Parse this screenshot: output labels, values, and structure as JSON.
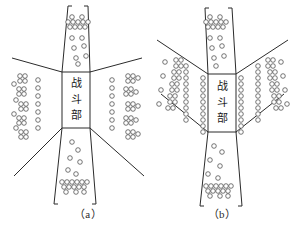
{
  "figure": {
    "background_color": "#ffffff",
    "line_color": "#2b2b2b",
    "circle_stroke_color": "#4a4a4a",
    "circle_fill_color": "#ffffff",
    "text_color": "#1a1a1a"
  },
  "panels": [
    {
      "id": "panel-a",
      "caption": "（a）",
      "caption_x": 88,
      "caption_y": 218,
      "warhead": {
        "label_chars": [
          "战",
          "斗",
          "部"
        ],
        "label_full": "战斗部",
        "x": 62,
        "y": 72,
        "width": 28,
        "height": 56
      },
      "outlines": [
        "M 62 72 L 68 6 L 72 6",
        "M 90 72 L 88 6 L 84 6",
        "M 62 128 L 54 204 L 58 204",
        "M 90 128 L 96 204 L 92 204",
        "M 62 72 L 12 58",
        "M 62 128 L 14 176",
        "M 90 72 L 142 58",
        "M 90 128 L 144 176"
      ],
      "circle_radius": 2.3,
      "circle_groups": [
        {
          "name": "top-cone-dense-band",
          "points": [
            [
              68,
              22
            ],
            [
              73,
              22
            ],
            [
              78,
              22
            ],
            [
              83,
              22
            ],
            [
              88,
              22
            ],
            [
              70,
              27
            ],
            [
              75,
              27
            ],
            [
              80,
              27
            ],
            [
              85,
              27
            ],
            [
              72,
              17
            ],
            [
              82,
              17
            ]
          ]
        },
        {
          "name": "top-cone-sparse",
          "points": [
            [
              72,
              38
            ],
            [
              82,
              38
            ],
            [
              74,
              48
            ],
            [
              84,
              46
            ],
            [
              76,
              58
            ],
            [
              86,
              56
            ],
            [
              78,
              64
            ]
          ]
        },
        {
          "name": "bottom-cone-sparse",
          "points": [
            [
              72,
              142
            ],
            [
              78,
              150
            ],
            [
              70,
              158
            ],
            [
              80,
              162
            ],
            [
              68,
              170
            ],
            [
              76,
              174
            ]
          ]
        },
        {
          "name": "bottom-cone-dense-band",
          "points": [
            [
              62,
              182
            ],
            [
              67,
              182
            ],
            [
              72,
              182
            ],
            [
              77,
              182
            ],
            [
              82,
              182
            ],
            [
              87,
              182
            ],
            [
              64,
              187
            ],
            [
              69,
              187
            ],
            [
              74,
              187
            ],
            [
              79,
              187
            ],
            [
              84,
              187
            ],
            [
              66,
              192
            ],
            [
              76,
              192
            ],
            [
              84,
              192
            ]
          ]
        },
        {
          "name": "left-fan-sparse-column",
          "points": [
            [
              38,
              80
            ],
            [
              38,
              88
            ],
            [
              38,
              96
            ],
            [
              38,
              104
            ],
            [
              38,
              112
            ],
            [
              38,
              120
            ],
            [
              38,
              128
            ]
          ]
        },
        {
          "name": "left-fan-dense-clusters",
          "points": [
            [
              20,
              76
            ],
            [
              25,
              76
            ],
            [
              20,
              81
            ],
            [
              25,
              81
            ],
            [
              14,
              84
            ],
            [
              19,
              89
            ],
            [
              24,
              89
            ],
            [
              19,
              94
            ],
            [
              24,
              94
            ],
            [
              16,
              100
            ],
            [
              21,
              104
            ],
            [
              26,
              104
            ],
            [
              21,
              109
            ],
            [
              26,
              109
            ],
            [
              14,
              114
            ],
            [
              19,
              118
            ],
            [
              24,
              118
            ],
            [
              19,
              123
            ],
            [
              24,
              123
            ],
            [
              16,
              128
            ],
            [
              21,
              132
            ],
            [
              26,
              132
            ],
            [
              21,
              137
            ],
            [
              26,
              137
            ]
          ]
        },
        {
          "name": "right-fan-sparse-column",
          "points": [
            [
              112,
              80
            ],
            [
              112,
              88
            ],
            [
              112,
              96
            ],
            [
              112,
              104
            ],
            [
              112,
              112
            ],
            [
              112,
              120
            ],
            [
              112,
              128
            ]
          ]
        },
        {
          "name": "right-fan-dense-clusters",
          "points": [
            [
              128,
              76
            ],
            [
              133,
              76
            ],
            [
              128,
              81
            ],
            [
              133,
              81
            ],
            [
              138,
              78
            ],
            [
              126,
              89
            ],
            [
              131,
              89
            ],
            [
              126,
              94
            ],
            [
              131,
              94
            ],
            [
              136,
              92
            ],
            [
              128,
              104
            ],
            [
              133,
              104
            ],
            [
              128,
              109
            ],
            [
              133,
              109
            ],
            [
              138,
              106
            ],
            [
              126,
              118
            ],
            [
              131,
              118
            ],
            [
              126,
              123
            ],
            [
              131,
              123
            ],
            [
              136,
              120
            ],
            [
              128,
              132
            ],
            [
              133,
              132
            ],
            [
              128,
              137
            ],
            [
              133,
              137
            ],
            [
              138,
              134
            ]
          ]
        }
      ]
    },
    {
      "id": "panel-b",
      "caption": "（b）",
      "caption_x": 222,
      "caption_y": 218,
      "warhead": {
        "label_chars": [
          "战",
          "斗",
          "部"
        ],
        "label_full": "战斗部",
        "x": 208,
        "y": 74,
        "width": 28,
        "height": 58
      },
      "outlines": [
        "M 208 74 L 205 8 L 209 8",
        "M 236 74 L 232 8 L 228 8",
        "M 208 132 L 200 206 L 204 206",
        "M 236 132 L 242 206 L 238 206",
        "M 208 74 L 157 40",
        "M 208 132 L 161 94",
        "M 236 74 L 288 40",
        "M 236 132 L 284 94"
      ],
      "circle_radius": 2.3,
      "circle_groups": [
        {
          "name": "top-cone-dense-band",
          "points": [
            [
              206,
              22
            ],
            [
              211,
              22
            ],
            [
              216,
              22
            ],
            [
              221,
              22
            ],
            [
              226,
              22
            ],
            [
              208,
              27
            ],
            [
              213,
              27
            ],
            [
              218,
              27
            ],
            [
              223,
              27
            ],
            [
              210,
              17
            ],
            [
              220,
              17
            ]
          ]
        },
        {
          "name": "top-cone-sparse",
          "points": [
            [
              210,
              38
            ],
            [
              220,
              38
            ],
            [
              212,
              48
            ],
            [
              222,
              46
            ],
            [
              214,
              58
            ],
            [
              224,
              56
            ],
            [
              216,
              66
            ]
          ]
        },
        {
          "name": "bottom-cone-sparse",
          "points": [
            [
              214,
              146
            ],
            [
              222,
              152
            ],
            [
              210,
              160
            ],
            [
              220,
              166
            ],
            [
              208,
              174
            ],
            [
              218,
              178
            ]
          ]
        },
        {
          "name": "bottom-cone-dense-band",
          "points": [
            [
              206,
              186
            ],
            [
              211,
              186
            ],
            [
              216,
              186
            ],
            [
              221,
              186
            ],
            [
              226,
              186
            ],
            [
              231,
              186
            ],
            [
              208,
              191
            ],
            [
              213,
              191
            ],
            [
              218,
              191
            ],
            [
              223,
              191
            ],
            [
              228,
              191
            ],
            [
              210,
              196
            ],
            [
              220,
              196
            ],
            [
              228,
              196
            ]
          ]
        },
        {
          "name": "left-inner-column",
          "points": [
            [
              203,
              78
            ],
            [
              203,
              84
            ],
            [
              203,
              90
            ],
            [
              203,
              96
            ],
            [
              203,
              102
            ],
            [
              203,
              108
            ],
            [
              203,
              114
            ],
            [
              203,
              120
            ],
            [
              203,
              126
            ],
            [
              203,
              132
            ]
          ]
        },
        {
          "name": "left-mid-column",
          "points": [
            [
              186,
              66
            ],
            [
              186,
              72
            ],
            [
              186,
              78
            ],
            [
              186,
              84
            ],
            [
              186,
              90
            ],
            [
              186,
              96
            ],
            [
              186,
              102
            ],
            [
              186,
              108
            ],
            [
              186,
              114
            ],
            [
              186,
              120
            ]
          ]
        },
        {
          "name": "left-outer-clusters",
          "points": [
            [
              176,
              60
            ],
            [
              181,
              60
            ],
            [
              176,
              66
            ],
            [
              181,
              66
            ],
            [
              174,
              72
            ],
            [
              179,
              72
            ],
            [
              174,
              78
            ],
            [
              179,
              78
            ],
            [
              172,
              84
            ],
            [
              177,
              84
            ],
            [
              172,
              90
            ],
            [
              177,
              90
            ],
            [
              170,
              96
            ],
            [
              175,
              96
            ],
            [
              170,
              102
            ],
            [
              175,
              102
            ],
            [
              168,
              108
            ],
            [
              173,
              108
            ],
            [
              165,
              62
            ],
            [
              163,
              76
            ],
            [
              161,
              90
            ],
            [
              159,
              104
            ]
          ]
        },
        {
          "name": "right-inner-column",
          "points": [
            [
              241,
              78
            ],
            [
              241,
              84
            ],
            [
              241,
              90
            ],
            [
              241,
              96
            ],
            [
              241,
              102
            ],
            [
              241,
              108
            ],
            [
              241,
              114
            ],
            [
              241,
              120
            ],
            [
              241,
              126
            ],
            [
              241,
              132
            ]
          ]
        },
        {
          "name": "right-mid-column",
          "points": [
            [
              258,
              66
            ],
            [
              258,
              72
            ],
            [
              258,
              78
            ],
            [
              258,
              84
            ],
            [
              258,
              90
            ],
            [
              258,
              96
            ],
            [
              258,
              102
            ],
            [
              258,
              108
            ],
            [
              258,
              114
            ],
            [
              258,
              120
            ]
          ]
        },
        {
          "name": "right-outer-clusters",
          "points": [
            [
              268,
              60
            ],
            [
              273,
              60
            ],
            [
              268,
              66
            ],
            [
              273,
              66
            ],
            [
              270,
              72
            ],
            [
              275,
              72
            ],
            [
              270,
              78
            ],
            [
              275,
              78
            ],
            [
              272,
              84
            ],
            [
              277,
              84
            ],
            [
              272,
              90
            ],
            [
              277,
              90
            ],
            [
              274,
              96
            ],
            [
              279,
              96
            ],
            [
              274,
              102
            ],
            [
              279,
              102
            ],
            [
              276,
              108
            ],
            [
              281,
              108
            ],
            [
              281,
              62
            ],
            [
              283,
              76
            ],
            [
              285,
              90
            ],
            [
              287,
              104
            ]
          ]
        }
      ]
    }
  ]
}
